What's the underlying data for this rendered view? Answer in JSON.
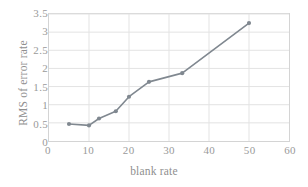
{
  "chart_data": {
    "type": "line",
    "title": "",
    "xlabel": "blank rate",
    "ylabel": "RMS of error rate",
    "xlim": [
      0,
      60
    ],
    "ylim": [
      0,
      3.5
    ],
    "xticks": [
      "0",
      "10",
      "20",
      "30",
      "40",
      "50",
      "60"
    ],
    "xtick_values": [
      0,
      10,
      20,
      30,
      40,
      50,
      60
    ],
    "yticks": [
      "0",
      "0.5",
      "1",
      "1.5",
      "2",
      "2.5",
      "3",
      "3.5"
    ],
    "ytick_values": [
      0,
      0.5,
      1,
      1.5,
      2,
      2.5,
      3,
      3.5
    ],
    "grid": "horizontal-and-vertical",
    "legend": "none",
    "series": [
      {
        "name": "RMS of error rate",
        "color": "#808890",
        "marker": "circle",
        "x": [
          5,
          10,
          12.5,
          16.7,
          20,
          25,
          33.3,
          50
        ],
        "y": [
          0.47,
          0.43,
          0.62,
          0.82,
          1.22,
          1.63,
          1.87,
          3.25
        ]
      }
    ]
  },
  "colors": {
    "series_line": "#808890",
    "grid": "#e3e3e3",
    "frame": "#d4d4d4",
    "tick_text": "#9a9a9a",
    "axis_title_text": "#8f8f8f",
    "background": "#ffffff"
  }
}
